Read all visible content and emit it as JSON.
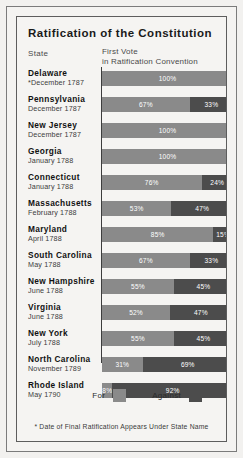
{
  "chart_data": {
    "type": "bar",
    "title": "Ratification of the Constitution",
    "subtitle_left": "State",
    "subtitle_right_line1": "First Vote",
    "subtitle_right_line2": "in Ratification Convention",
    "xlabel": "",
    "ylabel": "",
    "xlim": [
      0,
      100
    ],
    "grid": false,
    "orientation": "horizontal-stacked",
    "legend_position": "bottom-right",
    "legend": [
      {
        "name": "For",
        "color": "#8a8a8a"
      },
      {
        "name": "Against",
        "color": "#4c4c4c"
      }
    ],
    "series": [
      {
        "name": "For",
        "values": [
          100,
          67,
          100,
          100,
          76,
          53,
          85,
          67,
          55,
          52,
          55,
          31,
          8
        ]
      },
      {
        "name": "Against",
        "values": [
          0,
          33,
          0,
          0,
          24,
          47,
          15,
          33,
          45,
          47,
          45,
          69,
          92
        ]
      }
    ],
    "categories": [
      "Delaware",
      "Pennsylvania",
      "New Jersey",
      "Georgia",
      "Connecticut",
      "Massachusetts",
      "Maryland",
      "South Carolina",
      "New Hampshire",
      "Virginia",
      "New York",
      "North Carolina",
      "Rhode Island"
    ],
    "annotation": "* Date of Final Ratification Appears Under State Name",
    "rows": [
      {
        "state": "Delaware",
        "date": "December 1787",
        "asterisk": "*",
        "for": 100,
        "against": 0,
        "for_label": "100%",
        "against_label": ""
      },
      {
        "state": "Pennsylvania",
        "date": "December 1787",
        "asterisk": "",
        "for": 67,
        "against": 33,
        "for_label": "67%",
        "against_label": "33%"
      },
      {
        "state": "New Jersey",
        "date": "December 1787",
        "asterisk": "",
        "for": 100,
        "against": 0,
        "for_label": "100%",
        "against_label": ""
      },
      {
        "state": "Georgia",
        "date": "January 1788",
        "asterisk": "",
        "for": 100,
        "against": 0,
        "for_label": "100%",
        "against_label": ""
      },
      {
        "state": "Connecticut",
        "date": "January 1788",
        "asterisk": "",
        "for": 76,
        "against": 24,
        "for_label": "76%",
        "against_label": "24%"
      },
      {
        "state": "Massachusetts",
        "date": "February 1788",
        "asterisk": "",
        "for": 53,
        "against": 47,
        "for_label": "53%",
        "against_label": "47%"
      },
      {
        "state": "Maryland",
        "date": "April 1788",
        "asterisk": "",
        "for": 85,
        "against": 15,
        "for_label": "85%",
        "against_label": "15%"
      },
      {
        "state": "South Carolina",
        "date": "May 1788",
        "asterisk": "",
        "for": 67,
        "against": 33,
        "for_label": "67%",
        "against_label": "33%"
      },
      {
        "state": "New Hampshire",
        "date": "June 1788",
        "asterisk": "",
        "for": 55,
        "against": 45,
        "for_label": "55%",
        "against_label": "45%"
      },
      {
        "state": "Virginia",
        "date": "June 1788",
        "asterisk": "",
        "for": 52,
        "against": 47,
        "for_label": "52%",
        "against_label": "47%"
      },
      {
        "state": "New York",
        "date": "July 1788",
        "asterisk": "",
        "for": 55,
        "against": 45,
        "for_label": "55%",
        "against_label": "45%"
      },
      {
        "state": "North Carolina",
        "date": "November 1789",
        "asterisk": "",
        "for": 31,
        "against": 69,
        "for_label": "31%",
        "against_label": "69%"
      },
      {
        "state": "Rhode Island",
        "date": "May 1790",
        "asterisk": "",
        "for": 8,
        "against": 92,
        "for_label": "8%",
        "against_label": "92%"
      }
    ]
  },
  "colors": {
    "for": "#8a8a8a",
    "against": "#4c4c4c",
    "axis": "#3d3d3d",
    "paper": "#f5f4f2"
  }
}
